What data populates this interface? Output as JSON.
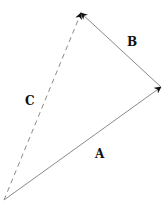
{
  "diagram": {
    "type": "vector-addition",
    "vectors": [
      {
        "name": "A",
        "label": "A",
        "from": [
          4,
          200
        ],
        "to": [
          161,
          87
        ],
        "style": "solid"
      },
      {
        "name": "B",
        "label": "B",
        "from": [
          161,
          87
        ],
        "to": [
          81,
          13
        ],
        "style": "solid"
      },
      {
        "name": "C",
        "label": "C",
        "from": [
          4,
          200
        ],
        "to": [
          81,
          13
        ],
        "style": "dashed"
      }
    ],
    "colors": {
      "line": "#8a8a8a",
      "arrowhead": "#111111",
      "label": "#111111"
    }
  },
  "labels": {
    "a": "A",
    "b": "B",
    "c": "C"
  }
}
